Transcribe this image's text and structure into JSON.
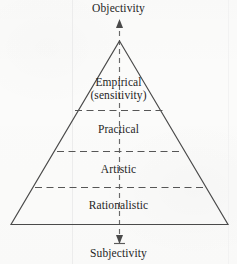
{
  "figure": {
    "type": "pyramid-diagram",
    "axis": {
      "top_label": "Objectivity",
      "bottom_label": "Subjectivity",
      "top_arrow_icon": "arrow-up-icon",
      "bottom_arrow_icon": "arrow-down-icon",
      "orientation": "vertical",
      "style": "dashed",
      "color": "#6a6a6a"
    },
    "tiers": [
      {
        "label": "Empirical",
        "sublabel": "(sensitivity)",
        "position": 1
      },
      {
        "label": "Practical",
        "sublabel": "",
        "position": 2
      },
      {
        "label": "Artistic",
        "sublabel": "",
        "position": 3
      },
      {
        "label": "Rationalistic",
        "sublabel": "",
        "position": 4
      }
    ],
    "outline_color": "#4a4a4a",
    "divider_color": "#565656",
    "background_color": "#fbfbfa"
  }
}
